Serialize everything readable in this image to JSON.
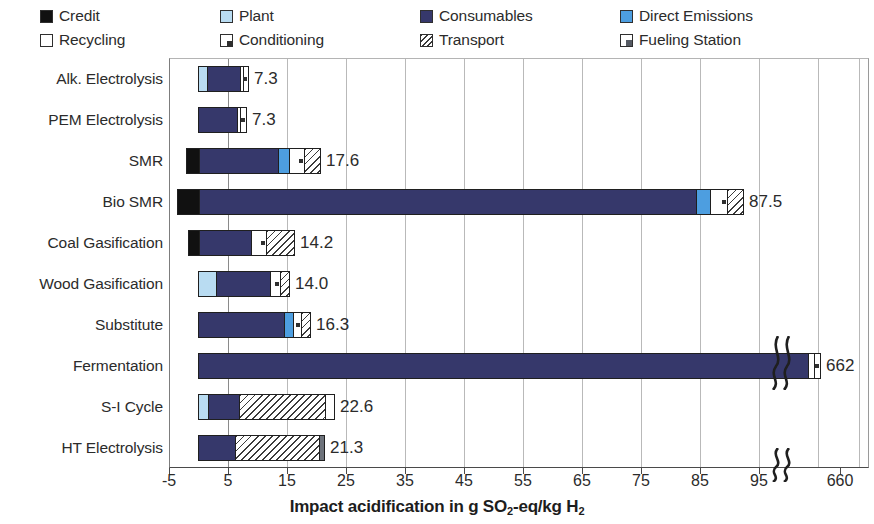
{
  "legend": {
    "items": [
      {
        "label": "Credit",
        "key": "credit",
        "color": "#111111",
        "pattern": "solid"
      },
      {
        "label": "Plant",
        "key": "plant",
        "color": "#b9dcf2",
        "pattern": "solid"
      },
      {
        "label": "Consumables",
        "key": "consumables",
        "color": "#36386b",
        "pattern": "solid"
      },
      {
        "label": "Direct Emissions",
        "key": "direct",
        "color": "#4d9ee0",
        "pattern": "solid"
      },
      {
        "label": "Recycling",
        "key": "recycling",
        "color": "#ffffff",
        "pattern": "outline"
      },
      {
        "label": "Conditioning",
        "key": "conditioning",
        "color": "#ffffff",
        "pattern": "corner-mark"
      },
      {
        "label": "Transport",
        "key": "transport",
        "color": "#ffffff",
        "pattern": "diagonal-hatch"
      },
      {
        "label": "Fueling Station",
        "key": "fueling",
        "color": "#6e737c",
        "pattern": "corner-block"
      }
    ]
  },
  "axis": {
    "x_title_main": "Impact acidification in g SO",
    "x_title_sub": "2",
    "x_title_tail": "-eq/kg H",
    "x_title_sub2": "2",
    "x_ticks": [
      "-5",
      "5",
      "15",
      "25",
      "35",
      "45",
      "55",
      "65",
      "75",
      "85",
      "95",
      "660"
    ],
    "break_marker": "axis-break"
  },
  "chart_data": {
    "type": "bar",
    "orientation": "horizontal",
    "title": "",
    "xlabel": "Impact acidification in g SO2-eq/kg H2",
    "ylabel": "",
    "xlim": [
      -5,
      95
    ],
    "xticks": [
      -5,
      5,
      15,
      25,
      35,
      45,
      55,
      65,
      75,
      85,
      95,
      660
    ],
    "axis_break": {
      "after": 95,
      "resumes_at": 655
    },
    "grid": "vertical",
    "legend_position": "top",
    "categories": [
      "Alk. Electrolysis",
      "PEM Electrolysis",
      "SMR",
      "Bio SMR",
      "Coal Gasification",
      "Wood Gasification",
      "Substitute",
      "Fermentation",
      "S-I Cycle",
      "HT Electrolysis"
    ],
    "totals": [
      7.3,
      7.3,
      17.6,
      87.5,
      14.2,
      14.0,
      16.3,
      662,
      22.6,
      21.3
    ],
    "total_labels": [
      "7.3",
      "7.3",
      "17.6",
      "87.5",
      "14.2",
      "14.0",
      "16.3",
      "662",
      "22.6",
      "21.3"
    ],
    "series": [
      {
        "name": "Credit",
        "values": [
          0,
          0,
          -2.0,
          -3.6,
          -1.7,
          0,
          0,
          0,
          0,
          0
        ]
      },
      {
        "name": "Plant",
        "values": [
          1.0,
          0,
          0,
          0,
          0,
          2.2,
          0,
          0,
          1.2,
          0
        ]
      },
      {
        "name": "Consumables",
        "values": [
          5.6,
          6.4,
          13.4,
          84.3,
          8.8,
          9.2,
          14.4,
          660.2,
          5.2,
          6.1
        ]
      },
      {
        "name": "Direct Emissions",
        "values": [
          0,
          0,
          1.4,
          1.3,
          0,
          0,
          0.7,
          0,
          0,
          0
        ]
      },
      {
        "name": "Recycling",
        "values": [
          0.3,
          0.4,
          0,
          0,
          0,
          0,
          0,
          0.9,
          0.9,
          0
        ]
      },
      {
        "name": "Conditioning",
        "values": [
          0.4,
          0.5,
          1.0,
          0.8,
          1.1,
          1.4,
          0.6,
          0.9,
          0,
          0
        ]
      },
      {
        "name": "Transport",
        "values": [
          0,
          0,
          1.8,
          1.1,
          4.3,
          1.2,
          0.6,
          0,
          15.3,
          14.8
        ]
      },
      {
        "name": "Fueling Station",
        "values": [
          0,
          0,
          0,
          0,
          0,
          0,
          0,
          0,
          0,
          0.4
        ]
      }
    ]
  },
  "bars": [
    {
      "category": "Alk. Electrolysis",
      "label": "7.3",
      "segments": [
        {
          "key": "plant",
          "w": 8
        },
        {
          "key": "consumables",
          "w": 33
        },
        {
          "key": "recycling",
          "w": 3
        },
        {
          "key": "conditioning",
          "w": 5
        }
      ],
      "start": 0
    },
    {
      "category": "PEM Electrolysis",
      "label": "7.3",
      "segments": [
        {
          "key": "consumables",
          "w": 38
        },
        {
          "key": "recycling",
          "w": 3
        },
        {
          "key": "conditioning",
          "w": 6
        }
      ],
      "start": 0
    },
    {
      "category": "SMR",
      "label": "17.6",
      "segments": [
        {
          "key": "credit",
          "w": 12
        },
        {
          "key": "consumables",
          "w": 79
        },
        {
          "key": "direct",
          "w": 11
        },
        {
          "key": "conditioning",
          "w": 15
        },
        {
          "key": "transport",
          "w": 16
        }
      ],
      "start": -12
    },
    {
      "category": "Bio SMR",
      "label": "87.5",
      "segments": [
        {
          "key": "credit",
          "w": 21
        },
        {
          "key": "consumables",
          "w": 497
        },
        {
          "key": "direct",
          "w": 14
        },
        {
          "key": "conditioning",
          "w": 17
        },
        {
          "key": "transport",
          "w": 16
        }
      ],
      "start": -21
    },
    {
      "category": "Coal Gasification",
      "label": "14.2",
      "segments": [
        {
          "key": "credit",
          "w": 10
        },
        {
          "key": "consumables",
          "w": 52
        },
        {
          "key": "conditioning",
          "w": 15
        },
        {
          "key": "transport",
          "w": 28
        }
      ],
      "start": -10
    },
    {
      "category": "Wood Gasification",
      "label": "14.0",
      "segments": [
        {
          "key": "plant",
          "w": 17
        },
        {
          "key": "consumables",
          "w": 54
        },
        {
          "key": "conditioning",
          "w": 10
        },
        {
          "key": "transport",
          "w": 9
        }
      ],
      "start": 0
    },
    {
      "category": "Substitute",
      "label": "16.3",
      "segments": [
        {
          "key": "consumables",
          "w": 85
        },
        {
          "key": "direct",
          "w": 9
        },
        {
          "key": "conditioning",
          "w": 8
        },
        {
          "key": "transport",
          "w": 9
        }
      ],
      "start": 0
    },
    {
      "category": "Fermentation",
      "label": "662",
      "segments": [
        {
          "key": "consumables",
          "w": 609
        },
        {
          "key": "recycling",
          "w": 6
        },
        {
          "key": "conditioning",
          "w": 6
        }
      ],
      "start": 0
    },
    {
      "category": "S-I Cycle",
      "label": "22.6",
      "segments": [
        {
          "key": "plant",
          "w": 9
        },
        {
          "key": "consumables",
          "w": 31
        },
        {
          "key": "transport",
          "w": 86
        },
        {
          "key": "recycling",
          "w": 9
        }
      ],
      "start": 0
    },
    {
      "category": "HT Electrolysis",
      "label": "21.3",
      "segments": [
        {
          "key": "consumables",
          "w": 36
        },
        {
          "key": "transport",
          "w": 84
        },
        {
          "key": "fueling",
          "w": 5
        }
      ],
      "start": 0
    }
  ]
}
